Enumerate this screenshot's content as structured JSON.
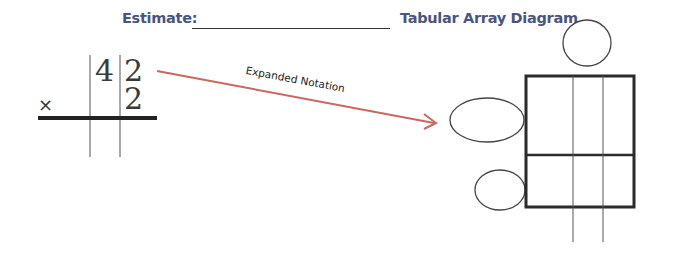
{
  "header": {
    "estimate_label": "Estimate:",
    "estimate_value": "",
    "title": "Tabular Array Diagram"
  },
  "multiplication": {
    "operator": "×",
    "multiplicand_tens": "4",
    "multiplicand_ones": "2",
    "multiplier_ones": "2"
  },
  "arrow": {
    "label": "Expanded Notation",
    "color": "#c8685f"
  },
  "tabular_array": {
    "rows": 2,
    "columns": 3,
    "top_factor_circle": "",
    "row_factor_ovals": [
      "",
      ""
    ],
    "border_color": "#2b2b2b"
  },
  "colors": {
    "heading": "#4a5482",
    "ink": "#2b2b2b",
    "arrow": "#c8685f"
  }
}
